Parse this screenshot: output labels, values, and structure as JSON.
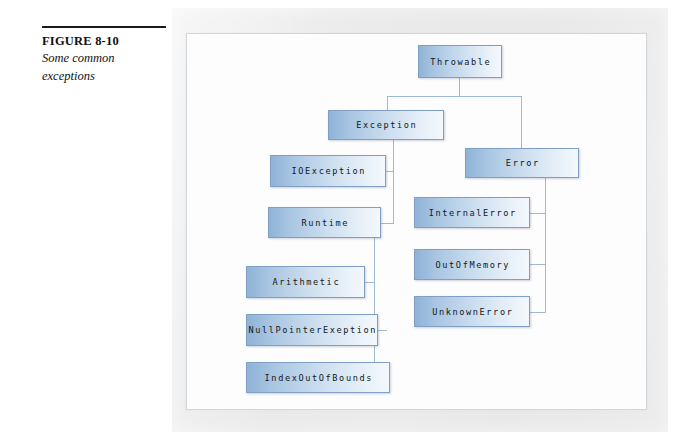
{
  "figure": {
    "label": "FIGURE 8-10",
    "caption_line1": "Some common",
    "caption_line2": "exceptions"
  },
  "diagram": {
    "type": "tree",
    "colors": {
      "node_fill_dark": "#8fb2d6",
      "node_fill_light": "#f4f8fc",
      "node_border": "#7fa0c4",
      "connector": "#9fb9d4",
      "panel_background": "#e9e9ea",
      "inner_panel": "#fdfdfd",
      "text": "#121821"
    },
    "nodes": [
      {
        "id": "throwable",
        "label": "Throwable",
        "x": 232,
        "y": 12,
        "w": 84,
        "h": 33
      },
      {
        "id": "exception",
        "label": "Exception",
        "x": 142,
        "y": 77,
        "w": 116,
        "h": 30
      },
      {
        "id": "error",
        "label": "Error",
        "x": 279,
        "y": 115,
        "w": 114,
        "h": 30
      },
      {
        "id": "ioexception",
        "label": "IOException",
        "x": 84,
        "y": 122,
        "w": 116,
        "h": 32
      },
      {
        "id": "runtime",
        "label": "Runtime",
        "x": 82,
        "y": 174,
        "w": 113,
        "h": 31
      },
      {
        "id": "internalerror",
        "label": "InternalError",
        "x": 228,
        "y": 164,
        "w": 116,
        "h": 31
      },
      {
        "id": "outofmemory",
        "label": "OutOfMemory",
        "x": 228,
        "y": 216,
        "w": 116,
        "h": 31
      },
      {
        "id": "unknownerror",
        "label": "UnknownError",
        "x": 228,
        "y": 263,
        "w": 116,
        "h": 31
      },
      {
        "id": "arithmetic",
        "label": "Arithmetic",
        "x": 60,
        "y": 233,
        "w": 119,
        "h": 32
      },
      {
        "id": "nullpointer",
        "label": "NullPointerExeption",
        "x": 60,
        "y": 281,
        "w": 132,
        "h": 32
      },
      {
        "id": "indexoutofbounds",
        "label": "IndexOutOfBounds",
        "x": 60,
        "y": 329,
        "w": 144,
        "h": 31
      }
    ],
    "edges": [
      {
        "from": "throwable",
        "to": "exception"
      },
      {
        "from": "throwable",
        "to": "error"
      },
      {
        "from": "exception",
        "to": "ioexception"
      },
      {
        "from": "exception",
        "to": "runtime"
      },
      {
        "from": "error",
        "to": "internalerror"
      },
      {
        "from": "error",
        "to": "outofmemory"
      },
      {
        "from": "error",
        "to": "unknownerror"
      },
      {
        "from": "runtime",
        "to": "arithmetic"
      },
      {
        "from": "runtime",
        "to": "nullpointer"
      },
      {
        "from": "runtime",
        "to": "indexoutofbounds"
      }
    ],
    "connectors": [
      {
        "name": "throwable-stem",
        "type": "v",
        "x": 273,
        "y": 45,
        "len": 18
      },
      {
        "name": "throwable-bus",
        "type": "h",
        "x": 201,
        "y": 63,
        "len": 134
      },
      {
        "name": "throwable-to-exception",
        "type": "v",
        "x": 201,
        "y": 63,
        "len": 14
      },
      {
        "name": "throwable-to-error",
        "type": "v",
        "x": 335,
        "y": 63,
        "len": 52
      },
      {
        "name": "exception-stem",
        "type": "v",
        "x": 207,
        "y": 107,
        "len": 84
      },
      {
        "name": "exception-to-io",
        "type": "h",
        "x": 200,
        "y": 138,
        "len": 8
      },
      {
        "name": "exception-to-runtime",
        "type": "h",
        "x": 195,
        "y": 190,
        "len": 13
      },
      {
        "name": "error-stem",
        "type": "v",
        "x": 359,
        "y": 145,
        "len": 134
      },
      {
        "name": "error-to-internal",
        "type": "h",
        "x": 344,
        "y": 180,
        "len": 16
      },
      {
        "name": "error-to-outofmemory",
        "type": "h",
        "x": 344,
        "y": 231,
        "len": 16
      },
      {
        "name": "error-to-unknown",
        "type": "h",
        "x": 344,
        "y": 279,
        "len": 16
      },
      {
        "name": "runtime-stem",
        "type": "v",
        "x": 188,
        "y": 205,
        "len": 140
      },
      {
        "name": "runtime-to-arithmetic",
        "type": "h",
        "x": 179,
        "y": 249,
        "len": 10
      },
      {
        "name": "runtime-to-nullptr",
        "type": "h",
        "x": 192,
        "y": 297,
        "len": 9
      },
      {
        "name": "runtime-to-indexoob",
        "type": "h",
        "x": 188,
        "y": 345,
        "len": 4
      }
    ]
  }
}
